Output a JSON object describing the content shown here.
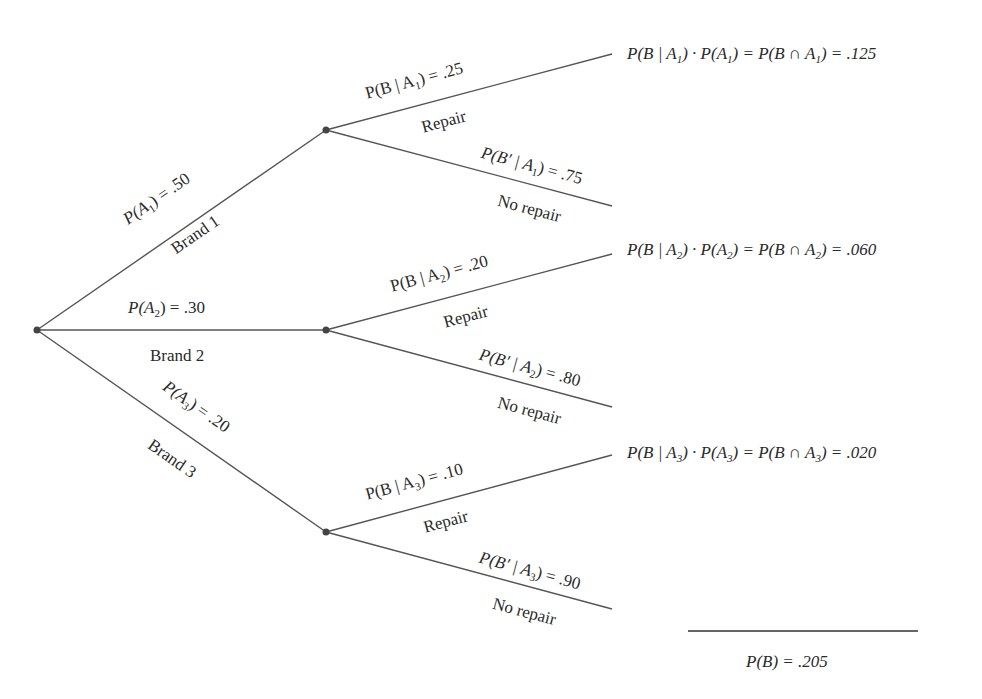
{
  "diagram": {
    "type": "probability-tree",
    "line_color": "#555555",
    "node_color": "#444444",
    "nodes": {
      "root": {
        "x": 37,
        "y": 330
      },
      "brand1": {
        "x": 326,
        "y": 130
      },
      "brand2": {
        "x": 326,
        "y": 330
      },
      "brand3": {
        "x": 326,
        "y": 532
      }
    },
    "first_level": [
      {
        "prob_label": "P(A1) = .50",
        "p": "P(A",
        "sub": "1",
        "rest": ") = .50",
        "event": "Brand 1",
        "value": 0.5
      },
      {
        "prob_label": "P(A2) = .30",
        "p": "P(A",
        "sub": "2",
        "rest": ") = .30",
        "event": "Brand 2",
        "value": 0.3
      },
      {
        "prob_label": "P(A3) = .20",
        "p": "P(A",
        "sub": "3",
        "rest": ") = .20",
        "event": "Brand 3",
        "value": 0.2
      }
    ],
    "second_level": [
      {
        "repair": {
          "p": "P(B | A",
          "sub": "1",
          "rest": ") = .25",
          "event": "Repair",
          "value": 0.25
        },
        "no_repair": {
          "p": "P(B′ | A",
          "sub": "1",
          "rest": ") = .75",
          "event": "No repair",
          "value": 0.75
        }
      },
      {
        "repair": {
          "p": "P(B | A",
          "sub": "2",
          "rest": ") = .20",
          "event": "Repair",
          "value": 0.2
        },
        "no_repair": {
          "p": "P(B′ | A",
          "sub": "2",
          "rest": ") = .80",
          "event": "No repair",
          "value": 0.8
        }
      },
      {
        "repair": {
          "p": "P(B | A",
          "sub": "3",
          "rest": ") = .10",
          "event": "Repair",
          "value": 0.1
        },
        "no_repair": {
          "p": "P(B′ | A",
          "sub": "3",
          "rest": ") = .90",
          "event": "No repair",
          "value": 0.9
        }
      }
    ],
    "results": [
      {
        "a": "P(B | A",
        "s1": "1",
        "b": ") · P(A",
        "s2": "1",
        "c": ") = P(B ∩ A",
        "s3": "1",
        "d": ") = .125",
        "value": 0.125
      },
      {
        "a": "P(B | A",
        "s1": "2",
        "b": ") · P(A",
        "s2": "2",
        "c": ") = P(B ∩ A",
        "s3": "2",
        "d": ") = .060",
        "value": 0.06
      },
      {
        "a": "P(B | A",
        "s1": "3",
        "b": ") · P(A",
        "s2": "3",
        "c": ") = P(B ∩ A",
        "s3": "3",
        "d": ") = .020",
        "value": 0.02
      }
    ],
    "total": {
      "label": "P(B) = .205",
      "value": 0.205
    }
  }
}
